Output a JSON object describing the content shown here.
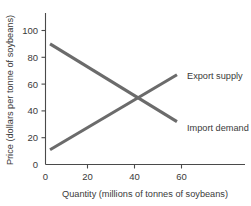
{
  "chart_data": {
    "type": "line",
    "title": "",
    "xlabel": "Quantity (millions of tonnes of soybeans)",
    "ylabel": "Price (dollars per tonne of soybeans)",
    "xlim": [
      0,
      80
    ],
    "ylim": [
      0,
      110
    ],
    "xticks": [
      0,
      20,
      40,
      60
    ],
    "yticks": [
      0,
      20,
      40,
      60,
      80,
      100
    ],
    "xtick_labels": [
      "0",
      "20",
      "40",
      "60"
    ],
    "ytick_labels": [
      "0",
      "20",
      "40",
      "60",
      "80",
      "100"
    ],
    "grid": false,
    "legend_position": "inline-right",
    "line_color": "#6b6b6b",
    "axis_color": "#4a4a4a",
    "background_color": "#ffffff",
    "series": [
      {
        "name": "Import demand",
        "label": "Import demand",
        "x": [
          2,
          58
        ],
        "values": [
          90,
          32
        ],
        "color": "#6b6b6b",
        "label_x": 60,
        "label_y": 30
      },
      {
        "name": "Export supply",
        "label": "Export supply",
        "x": [
          2,
          58
        ],
        "values": [
          11,
          67
        ],
        "color": "#6b6b6b",
        "label_x": 60,
        "label_y": 66
      }
    ],
    "annotations": [
      {
        "name": "equilibrium",
        "x": 40,
        "y": 50,
        "text": ""
      }
    ]
  }
}
